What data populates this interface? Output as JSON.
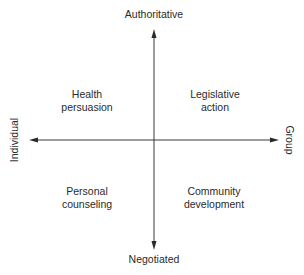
{
  "diagram": {
    "type": "quadrant",
    "axes": {
      "vertical": {
        "top_label": "Authoritative",
        "bottom_label": "Negotiated"
      },
      "horizontal": {
        "left_label": "Individual",
        "right_label": "Group"
      }
    },
    "quadrants": {
      "top_left": {
        "line1": "Health",
        "line2": "persuasion"
      },
      "top_right": {
        "line1": "Legislative",
        "line2": "action"
      },
      "bottom_left": {
        "line1": "Personal",
        "line2": "counseling"
      },
      "bottom_right": {
        "line1": "Community",
        "line2": "development"
      }
    },
    "colors": {
      "line": "#3a3a3a",
      "text": "#2a2a2a",
      "background": "#ffffff"
    }
  }
}
